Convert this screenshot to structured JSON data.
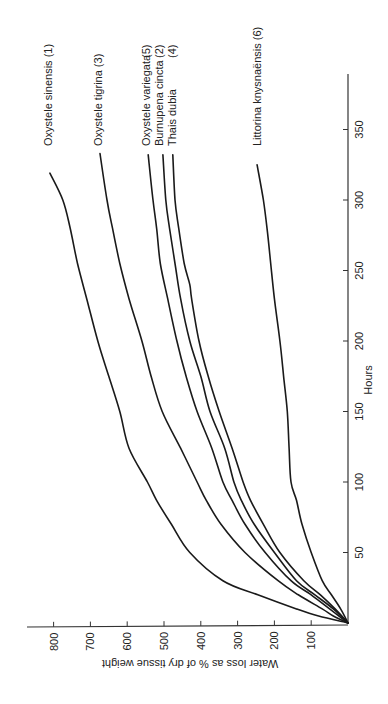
{
  "chart_data": {
    "type": "line",
    "orientation": "rotated-90-clockwise",
    "title": "",
    "xlabel": "Hours",
    "ylabel": "Water loss as % of dry tissue weight",
    "xlim": [
      0,
      375
    ],
    "ylim": [
      0,
      850
    ],
    "x_ticks": [
      50,
      100,
      150,
      200,
      250,
      300,
      350
    ],
    "y_ticks": [
      100,
      200,
      300,
      400,
      500,
      600,
      700,
      800
    ],
    "grid": false,
    "legend": "inline labels at curve ends",
    "series": [
      {
        "name": "Oxystele sinensis",
        "number": "(1)",
        "x": [
          0,
          5,
          10,
          20,
          30,
          50,
          70,
          87,
          100,
          124,
          150,
          175,
          200,
          230,
          255,
          280,
          300,
          319
        ],
        "y": [
          0,
          80,
          140,
          245,
          340,
          430,
          480,
          520,
          545,
          595,
          620,
          650,
          680,
          710,
          735,
          755,
          775,
          810
        ]
      },
      {
        "name": "Oxystele tigrina",
        "number": "(3)",
        "x": [
          0,
          5,
          10,
          20,
          30,
          50,
          70,
          87,
          100,
          124,
          150,
          175,
          200,
          230,
          255,
          280,
          300,
          333
        ],
        "y": [
          0,
          40,
          70,
          135,
          190,
          280,
          345,
          385,
          410,
          455,
          505,
          535,
          560,
          595,
          620,
          640,
          655,
          674
        ]
      },
      {
        "name": "Oxystele variegata",
        "number": "(5)",
        "x": [
          0,
          10,
          20,
          30,
          50,
          70,
          87,
          100,
          124,
          150,
          175,
          200,
          230,
          255,
          280,
          300,
          332
        ],
        "y": [
          0,
          50,
          100,
          155,
          225,
          280,
          315,
          340,
          370,
          410,
          440,
          465,
          490,
          510,
          520,
          530,
          543
        ]
      },
      {
        "name": "Burnupena cincta",
        "number": "(2)",
        "x": [
          0,
          10,
          20,
          30,
          50,
          70,
          87,
          100,
          124,
          150,
          175,
          200,
          230,
          255,
          280,
          300,
          332
        ],
        "y": [
          0,
          40,
          90,
          140,
          200,
          255,
          290,
          310,
          335,
          375,
          400,
          430,
          455,
          470,
          485,
          495,
          503
        ]
      },
      {
        "name": "Thais dubia",
        "number": "(4)",
        "x": [
          0,
          10,
          20,
          30,
          50,
          70,
          87,
          100,
          124,
          150,
          175,
          200,
          230,
          240,
          255,
          280,
          300,
          332
        ],
        "y": [
          0,
          35,
          75,
          120,
          185,
          230,
          265,
          285,
          315,
          350,
          380,
          405,
          425,
          430,
          445,
          460,
          470,
          476
        ]
      },
      {
        "name": "Littorina knysnaënsis",
        "number": "(6)",
        "x": [
          0,
          10,
          20,
          30,
          50,
          70,
          87,
          100,
          124,
          150,
          175,
          200,
          230,
          255,
          280,
          300,
          325
        ],
        "y": [
          0,
          20,
          45,
          70,
          100,
          125,
          140,
          155,
          160,
          165,
          175,
          185,
          200,
          210,
          220,
          230,
          247
        ]
      }
    ]
  },
  "labels": {
    "series": [
      "Oxystele sinensis  (1)",
      "Oxystele tigrina  (3)",
      "Oxystele variegata",
      "Burnupena cincta",
      "Thais dubia",
      "Littorina knysnaënsis  (6)"
    ],
    "group_numbers": [
      "(5)",
      "(2)",
      "(4)"
    ],
    "xlabel": "Hours",
    "ylabel": "Water loss as % of dry tissue weight",
    "x_ticks": [
      "50",
      "100",
      "150",
      "200",
      "250",
      "300",
      "350"
    ],
    "y_ticks": [
      "100",
      "200",
      "300",
      "400",
      "500",
      "600",
      "700",
      "800"
    ]
  }
}
